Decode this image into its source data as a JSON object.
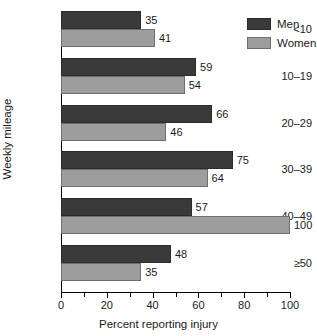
{
  "chart_data": {
    "type": "bar",
    "orientation": "horizontal",
    "title": "",
    "xlabel": "Percent reporting injury",
    "ylabel": "Weekly mileage",
    "xlim": [
      0,
      100
    ],
    "grid": false,
    "legend_position": "top-right",
    "categories": [
      "<10",
      "10–19",
      "20–29",
      "30–39",
      "40–49",
      "≥50"
    ],
    "xticks": [
      0,
      20,
      40,
      60,
      80,
      100
    ],
    "xtick_labels": [
      "0",
      "20",
      "40",
      "60",
      "80",
      "100"
    ],
    "minor_xticks": [
      10,
      30,
      50,
      70,
      90
    ],
    "series": [
      {
        "name": "Men",
        "color": "#3a3a3a",
        "values": [
          35,
          59,
          66,
          75,
          57,
          48
        ],
        "labels": [
          "35",
          "59",
          "66",
          "75",
          "57",
          "48"
        ]
      },
      {
        "name": "Women",
        "color": "#9d9d9d",
        "values": [
          41,
          54,
          46,
          64,
          100,
          35
        ],
        "labels": [
          "41",
          "54",
          "46",
          "64",
          "100",
          "35"
        ]
      }
    ]
  },
  "legend": {
    "items": [
      {
        "label": "Men",
        "color": "#3a3a3a"
      },
      {
        "label": "Women",
        "color": "#9d9d9d"
      }
    ]
  }
}
